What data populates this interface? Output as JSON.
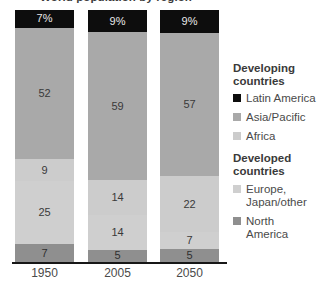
{
  "title_remnant": "World population by region",
  "chart_data": {
    "type": "bar",
    "title": "World population by region",
    "subtype": "stacked-100-percent",
    "xlabel": "",
    "ylabel": "",
    "ylim": [
      0,
      100
    ],
    "grid": false,
    "legend_position": "right",
    "categories": [
      "1950",
      "2005",
      "2050"
    ],
    "series": [
      {
        "name": "Latin America",
        "group": "Developing countries",
        "color": "#0d0d0d",
        "values": [
          7,
          9,
          9
        ],
        "labels": [
          "7%",
          "9%",
          "9%"
        ]
      },
      {
        "name": "Asia/Pacific",
        "group": "Developing countries",
        "color": "#a9a9a9",
        "values": [
          52,
          59,
          57
        ],
        "labels": [
          "52",
          "59",
          "57"
        ]
      },
      {
        "name": "Africa",
        "group": "Developing countries",
        "color": "#cccccc",
        "values": [
          9,
          14,
          22
        ],
        "labels": [
          "9",
          "14",
          "22"
        ]
      },
      {
        "name": "Europe, Japan/other",
        "group": "Developed countries",
        "color": "#cfcfcf",
        "values": [
          25,
          14,
          7
        ],
        "labels": [
          "25",
          "14",
          "7"
        ]
      },
      {
        "name": "North America",
        "group": "Developed countries",
        "color": "#8f8f8f",
        "values": [
          7,
          5,
          5
        ],
        "labels": [
          "7",
          "5",
          "5"
        ]
      }
    ],
    "stack_order_top_to_bottom": [
      "Latin America",
      "Asia/Pacific",
      "Africa",
      "Europe, Japan/other",
      "North America"
    ]
  },
  "bars": [
    {
      "category": "1950",
      "segments": [
        {
          "name": "Latin America",
          "label": "7%",
          "value": 7,
          "color": "#0d0d0d"
        },
        {
          "name": "Asia/Pacific",
          "label": "52",
          "value": 52,
          "color": "#a9a9a9"
        },
        {
          "name": "Africa",
          "label": "9",
          "value": 9,
          "color": "#cccccc"
        },
        {
          "name": "Europe, Japan/other",
          "label": "25",
          "value": 25,
          "color": "#cfcfcf"
        },
        {
          "name": "North America",
          "label": "7",
          "value": 7,
          "color": "#8f8f8f"
        }
      ]
    },
    {
      "category": "2005",
      "segments": [
        {
          "name": "Latin America",
          "label": "9%",
          "value": 9,
          "color": "#0d0d0d"
        },
        {
          "name": "Asia/Pacific",
          "label": "59",
          "value": 59,
          "color": "#a9a9a9"
        },
        {
          "name": "Africa",
          "label": "14",
          "value": 14,
          "color": "#cccccc"
        },
        {
          "name": "Europe, Japan/other",
          "label": "14",
          "value": 14,
          "color": "#cfcfcf"
        },
        {
          "name": "North America",
          "label": "5",
          "value": 5,
          "color": "#8f8f8f"
        }
      ]
    },
    {
      "category": "2050",
      "segments": [
        {
          "name": "Latin America",
          "label": "9%",
          "value": 9,
          "color": "#0d0d0d"
        },
        {
          "name": "Asia/Pacific",
          "label": "57",
          "value": 57,
          "color": "#a9a9a9"
        },
        {
          "name": "Africa",
          "label": "22",
          "value": 22,
          "color": "#cccccc"
        },
        {
          "name": "Europe, Japan/other",
          "label": "7",
          "value": 7,
          "color": "#cfcfcf"
        },
        {
          "name": "North America",
          "label": "5",
          "value": 5,
          "color": "#8f8f8f"
        }
      ]
    }
  ],
  "axis": {
    "tick_labels": [
      "1950",
      "2005",
      "2050"
    ]
  },
  "legend": {
    "groups": [
      {
        "heading": "Developing\ncountries",
        "heading_line1": "Developing",
        "heading_line2": "countries",
        "items": [
          {
            "label": "Latin America",
            "color": "#0d0d0d"
          },
          {
            "label": "Asia/Pacific",
            "color": "#a9a9a9"
          },
          {
            "label": "Africa",
            "color": "#cccccc"
          }
        ]
      },
      {
        "heading": "Developed\ncountries",
        "heading_line1": "Developed",
        "heading_line2": "countries",
        "items": [
          {
            "label": "Europe,\nJapan/other",
            "color": "#cfcfcf"
          },
          {
            "label": "North\nAmerica",
            "color": "#8f8f8f"
          }
        ]
      }
    ]
  }
}
